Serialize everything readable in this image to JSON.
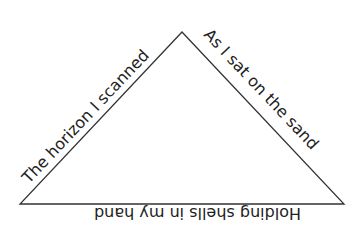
{
  "diagram": {
    "type": "triangle-poem",
    "stroke_color": "#333333",
    "text_color": "#222222",
    "background": "#ffffff",
    "vertices": {
      "apex": [
        182,
        32
      ],
      "bottom_left": [
        20,
        204
      ],
      "bottom_right": [
        344,
        204
      ]
    },
    "lines": {
      "left_side": "The horizon I scanned",
      "right_side": "As I sat on the sand",
      "bottom_side": "Holding shells in my hand"
    }
  }
}
